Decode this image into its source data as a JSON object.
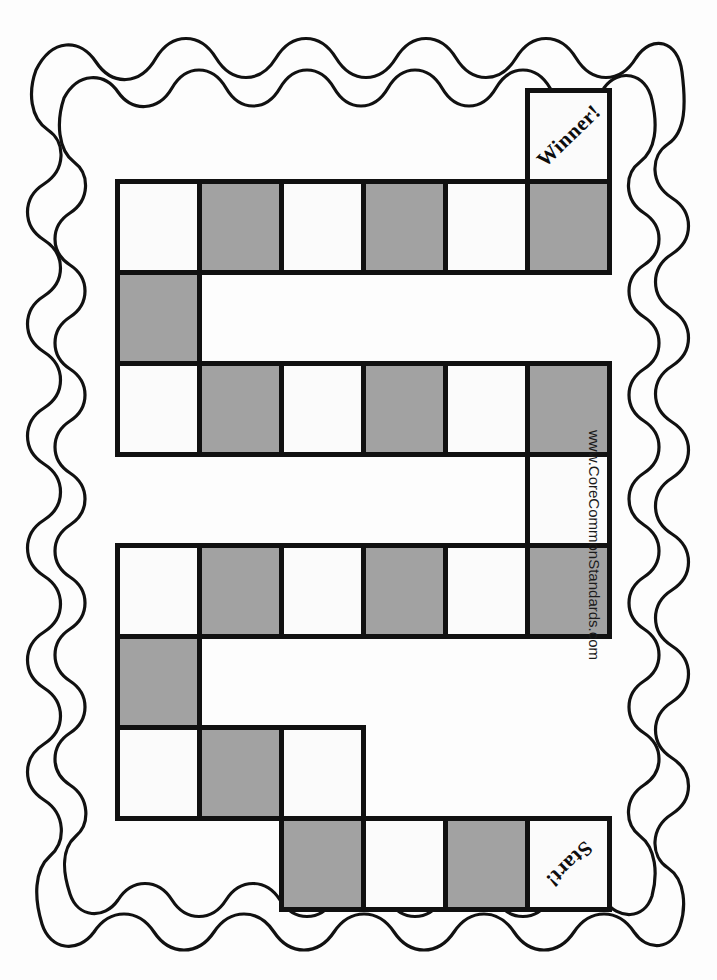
{
  "page": {
    "background_color": "#fdfdfd",
    "ink_color": "#111111",
    "shaded_cell_color": "#a2a2a2",
    "blank_cell_color": "#fbfbfb"
  },
  "credit": {
    "text": "www.CoreCommonStandards.com"
  },
  "board": {
    "title": "blank board game path",
    "columns": 6,
    "rows": 9,
    "cell_width": 82,
    "cell_height": 91,
    "origin_x": 115,
    "origin_y": 88,
    "start_label": "Start!",
    "winner_label": "Winner!",
    "cells": [
      {
        "row": 0,
        "col": 5,
        "shaded": false,
        "label": "Winner!",
        "label_style": "label-winner",
        "name": "board-cell-winner"
      },
      {
        "row": 1,
        "col": 0,
        "shaded": false,
        "label": "",
        "name": "board-cell-r1c0"
      },
      {
        "row": 1,
        "col": 1,
        "shaded": true,
        "label": "",
        "name": "board-cell-r1c1"
      },
      {
        "row": 1,
        "col": 2,
        "shaded": false,
        "label": "",
        "name": "board-cell-r1c2"
      },
      {
        "row": 1,
        "col": 3,
        "shaded": true,
        "label": "",
        "name": "board-cell-r1c3"
      },
      {
        "row": 1,
        "col": 4,
        "shaded": false,
        "label": "",
        "name": "board-cell-r1c4"
      },
      {
        "row": 1,
        "col": 5,
        "shaded": true,
        "label": "",
        "name": "board-cell-r1c5"
      },
      {
        "row": 2,
        "col": 0,
        "shaded": true,
        "label": "",
        "name": "board-cell-r2c0"
      },
      {
        "row": 3,
        "col": 0,
        "shaded": false,
        "label": "",
        "name": "board-cell-r3c0"
      },
      {
        "row": 3,
        "col": 1,
        "shaded": true,
        "label": "",
        "name": "board-cell-r3c1"
      },
      {
        "row": 3,
        "col": 2,
        "shaded": false,
        "label": "",
        "name": "board-cell-r3c2"
      },
      {
        "row": 3,
        "col": 3,
        "shaded": true,
        "label": "",
        "name": "board-cell-r3c3"
      },
      {
        "row": 3,
        "col": 4,
        "shaded": false,
        "label": "",
        "name": "board-cell-r3c4"
      },
      {
        "row": 3,
        "col": 5,
        "shaded": true,
        "label": "",
        "name": "board-cell-r3c5"
      },
      {
        "row": 4,
        "col": 5,
        "shaded": false,
        "label": "",
        "name": "board-cell-r4c5"
      },
      {
        "row": 5,
        "col": 0,
        "shaded": false,
        "label": "",
        "name": "board-cell-r5c0"
      },
      {
        "row": 5,
        "col": 1,
        "shaded": true,
        "label": "",
        "name": "board-cell-r5c1"
      },
      {
        "row": 5,
        "col": 2,
        "shaded": false,
        "label": "",
        "name": "board-cell-r5c2"
      },
      {
        "row": 5,
        "col": 3,
        "shaded": true,
        "label": "",
        "name": "board-cell-r5c3"
      },
      {
        "row": 5,
        "col": 4,
        "shaded": false,
        "label": "",
        "name": "board-cell-r5c4"
      },
      {
        "row": 5,
        "col": 5,
        "shaded": true,
        "label": "",
        "name": "board-cell-r5c5"
      },
      {
        "row": 6,
        "col": 0,
        "shaded": true,
        "label": "",
        "name": "board-cell-r6c0"
      },
      {
        "row": 7,
        "col": 0,
        "shaded": false,
        "label": "",
        "name": "board-cell-r7c0"
      },
      {
        "row": 7,
        "col": 1,
        "shaded": true,
        "label": "",
        "name": "board-cell-r7c1"
      },
      {
        "row": 7,
        "col": 2,
        "shaded": false,
        "label": "",
        "name": "board-cell-r7c2"
      },
      {
        "row": 8,
        "col": 2,
        "shaded": true,
        "label": "",
        "name": "board-cell-r8c2"
      },
      {
        "row": 8,
        "col": 3,
        "shaded": false,
        "label": "",
        "name": "board-cell-r8c3"
      },
      {
        "row": 8,
        "col": 4,
        "shaded": true,
        "label": "",
        "name": "board-cell-r8c4"
      },
      {
        "row": 8,
        "col": 5,
        "shaded": false,
        "label": "Start!",
        "label_style": "label-start",
        "name": "board-cell-start"
      }
    ]
  }
}
